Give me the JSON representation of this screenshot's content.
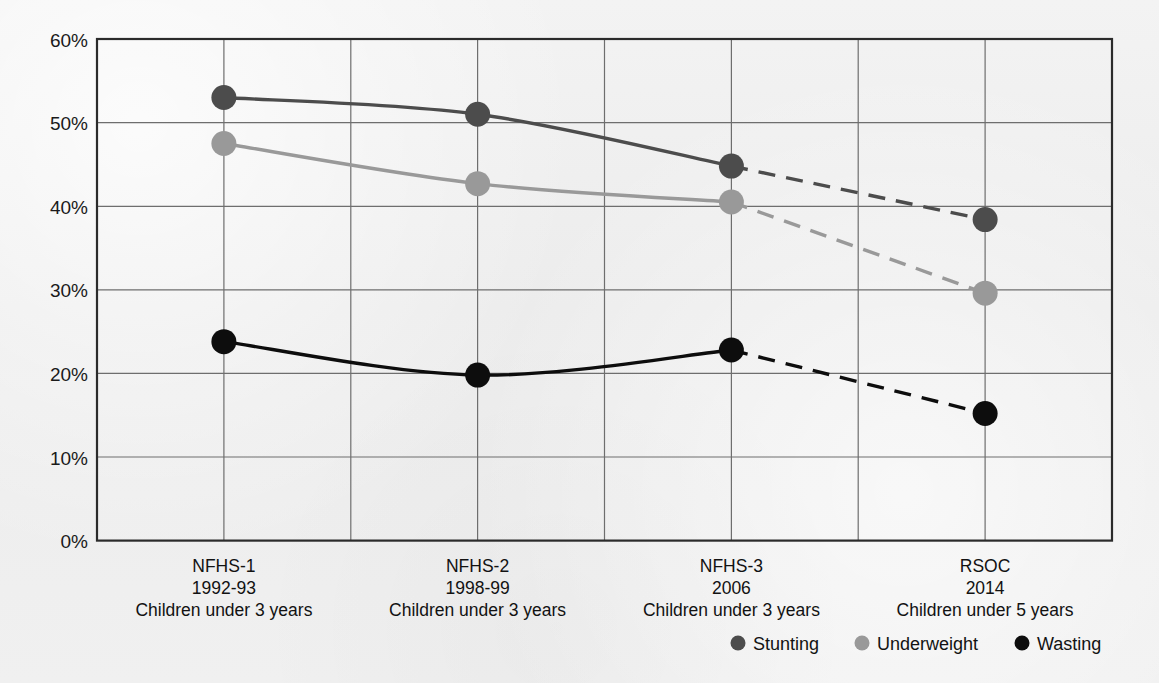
{
  "chart_data": {
    "type": "line",
    "title": "",
    "subtitle": "",
    "xlabel": "",
    "ylabel": "",
    "ylim": [
      0,
      60
    ],
    "ytick_values": [
      0,
      10,
      20,
      30,
      40,
      50,
      60
    ],
    "ytick_labels": [
      "0%",
      "10%",
      "20%",
      "30%",
      "40%",
      "50%",
      "60%"
    ],
    "grid": true,
    "legend_position": "bottom-right",
    "categories": [
      "NFHS-1",
      "NFHS-2",
      "NFHS-3",
      "RSOC"
    ],
    "category_labels": [
      {
        "survey": "NFHS-1",
        "period": "1992-93",
        "population": "Children under 3 years"
      },
      {
        "survey": "NFHS-2",
        "period": "1998-99",
        "population": "Children under 3 years"
      },
      {
        "survey": "NFHS-3",
        "period": "2006",
        "population": "Children under 3 years"
      },
      {
        "survey": "RSOC",
        "period": "2014",
        "population": "Children under 5 years"
      }
    ],
    "series": [
      {
        "name": "Stunting",
        "color": "#4c4c4c",
        "values": [
          53.0,
          51.0,
          44.8,
          38.4
        ],
        "dashed_from_index": 2
      },
      {
        "name": "Underweight",
        "color": "#999999",
        "values": [
          47.5,
          42.7,
          40.5,
          29.6
        ],
        "dashed_from_index": 2
      },
      {
        "name": "Wasting",
        "color": "#0d0d0d",
        "values": [
          23.8,
          19.8,
          22.8,
          15.2
        ],
        "dashed_from_index": 2
      }
    ]
  },
  "legend": {
    "items": [
      {
        "label": "Stunting",
        "color": "#4c4c4c"
      },
      {
        "label": "Underweight",
        "color": "#999999"
      },
      {
        "label": "Wasting",
        "color": "#0d0d0d"
      }
    ]
  },
  "colors": {
    "background": "#ececec",
    "plot_border": "#2b2b2b",
    "gridline": "#6e6e6e",
    "text": "#121212"
  }
}
